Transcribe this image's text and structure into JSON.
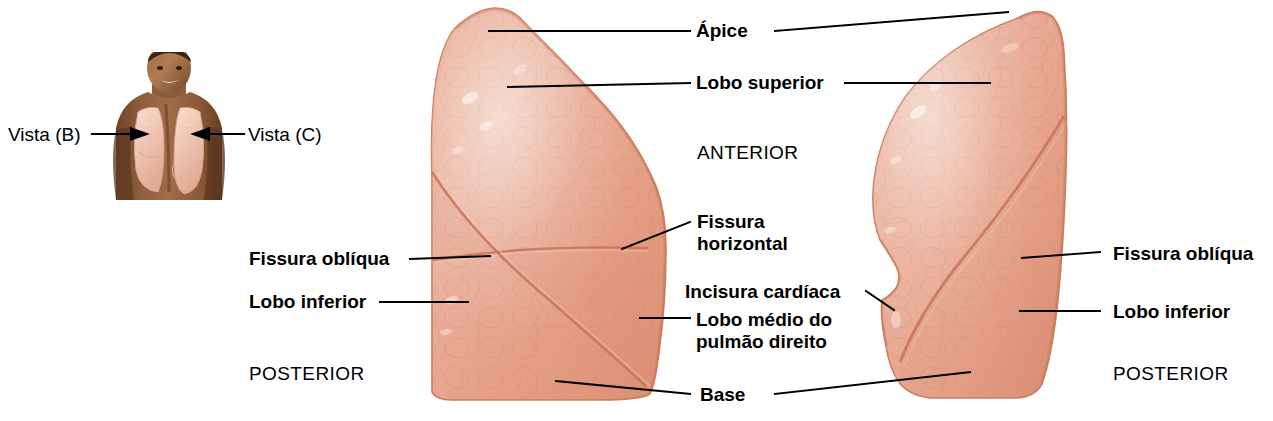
{
  "figure": {
    "background_color": "#ffffff",
    "tissue_color": "#e8a38c",
    "tissue_edge_color": "#d4805f",
    "line_color": "#000000"
  },
  "thumbnail": {
    "name": "torso-com-pulmoes",
    "description": "Fotografia de tórax masculino com os pulmões sobrepostos",
    "skin_color": "#8a5a3c",
    "lung_overlay_color": "#f3cfc0",
    "left_callout": "Vista (B)",
    "right_callout": "Vista (C)"
  },
  "orientation": {
    "anterior": "ANTERIOR",
    "posterior_left": "POSTERIOR",
    "posterior_right": "POSTERIOR"
  },
  "right_lung": {
    "name": "pulmao-direito",
    "view": "Vista (B)",
    "lobes": 3,
    "labels": {
      "apice": "Ápice",
      "lobo_superior": "Lobo superior",
      "fissura_horizontal": "Fissura\nhorizontal",
      "fissura_obliqua": "Fissura oblíqua",
      "lobo_inferior": "Lobo inferior",
      "lobo_medio": "Lobo médio do\npulmão direito"
    }
  },
  "left_lung": {
    "name": "pulmao-esquerdo",
    "view": "Vista (C)",
    "lobes": 2,
    "labels": {
      "incisura_cardiaca": "Incisura cardíaca",
      "fissura_obliqua": "Fissura oblíqua",
      "lobo_inferior": "Lobo inferior"
    }
  },
  "shared_labels": {
    "base": "Base"
  }
}
